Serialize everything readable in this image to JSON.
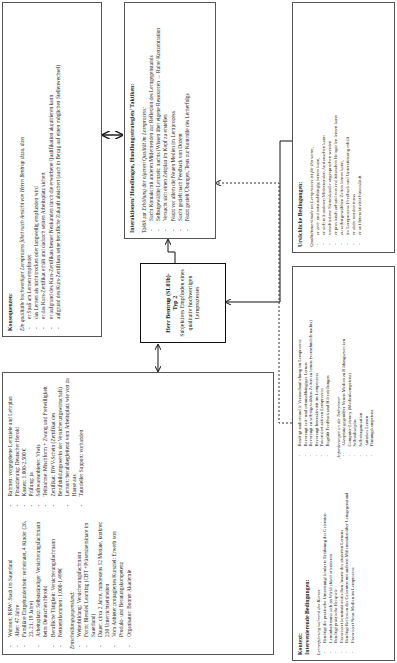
{
  "person_box": {
    "left_items": [
      "Wohnort: NRW: Stadt im Sauerland",
      "Alter: 47 Jahre",
      "Familiäre Eingebundenheit: verheiratet, 4 Kinder (26, 23, 21, 19 Jahre)",
      "Arbeitsplatz: Selbstständiger Versicherungsfachmann beim Deutschen Herold",
      "Berufliche Tätigkeit: Versicherungsfachmann",
      "Nettoeinkommen: 1.000-1.499€"
    ],
    "decision_heading": "Entscheidungsgegenstand:",
    "decision_items": [
      "Weiterbildung: Versicherungsfachmann",
      "Form: Blended Learning (CBT +Präsenzseminare im Sauerland)",
      "Dauer: circa 2 Jahre, mindestens 12 Monate, konkret: 230 Unterrichtseinheiten",
      "Vom Anbieter propagiertes Kursziel: Erwerb von Produkt- und Beratungskompetenz",
      "Organisator: Bonner Akademie"
    ],
    "right_items": [
      "Rahmen: vorgegebene Lernziele und Lehrplan",
      "Finanzierung: Deutscher Herold",
      "Kosten: 1.000-2.500 €",
      "Prüfung: ja",
      "Softwareanbieter: Viwis",
      "Teilnahme: Mischform + Zwang und Freiwilligkeit",
      "Zertifikat: BWV-Schein (Zertifikat des Berufsbildungswerks der Versicherungswirtschaft)",
      "Lernort: berufsbegleitend vom Arbeitsplatz wie von zu Hause aus",
      "Tutorieller Support: vorhanden"
    ]
  },
  "center_box": {
    "title": "Herr Bentrup (SL01b)-Typ 2",
    "subtitle": "Subjektives Empfinden eines qualitativ hochwertigen Lernprozesses"
  },
  "consequences_box": {
    "title": "Konsequenzen:",
    "intro": "Ein qualitativ hochwertiger Lernprozess führt nach Ansicht von Herrn Bentrup dazu, dass",
    "items": [
      "er Spaß am Lernen empfindet",
      "das Lernen als nicht trocken oder langweilig empfunden wird",
      "er das Kurs-Zertifikat erhält und dadurch seinen Arbeitsplatz sichert",
      "er aufgrund des Kurs-Zertifikats besser Neukunden durch die erworbene Qualifikation akquirieren kann",
      "aufgrund des Kurs-Zertifikats seine berufliche Zukunft absichert (auch in Bezug auf einen möglichen Stellenwechsel)"
    ]
  },
  "interactions_box": {
    "title": "Interaktionen/ Handlungen, Handlungsstrategien/ Taktiken:",
    "intro": "Taktik zur Erhöhung der eigenen Qualität im Lernprozess:",
    "items": [
      "Sucht Kontakt mit anderen Mitlernenden zur Reflexion des Lerngegenstands",
      "Selbstgewählte Lernzeit: nachts (Wissen über eigene Ressourcen → Ruhe/ Konzentration",
      "Versucht sich einen Zeitplan im Kopf zu erstellen",
      "Nutzt vor allem die Neuen Medien im Lernprozess",
      "Sucht gezielt nach Feedback von Dozent",
      "Nutzt gezielt Übungen, Tests zur Kontrolle des Lernerfolgs"
    ]
  },
  "context_box": {
    "title": "Kontext:",
    "subtitle": "Intervenierende Bedingungen:",
    "section1_heading": "Lernerfahrung während des Kurses:",
    "section1_items": [
      "Benötigt die praktische Umsetzung/ konkrete Erfahrung des Gelernten",
      "Lerninhalt muss sich an Wirklichkeit orientieren",
      "Benötigt praktische Beispiele",
      "Favorisiert konstruktivistischen Ansatz des situierten Lernens",
      "Benötigt Reflexion des Gelernten mit anderen Mitlernenden über Lerngegenstand",
      "Favorisiert Neue Medien im Lernprozess",
      "Benötigt audiovisuelle Veranschaulichung im Lernprozess",
      "Bevorzugt zeit- und ortsunabhängiges Lernen",
      "Bevorzugt zu selbstgewählten Zeiten zu lernen (vornehmlich nachts)",
      "Bevorzugt Interaktivität im Lernprozess",
      "Favorisiert aktiven Lernprozess",
      "Begrüßt Feedback und Hilfestellungen"
    ],
    "section2_heading": "Anforderungen an die Teilnehmer",
    "section2_items": [
      "Akzeptanz gegenüber Neuen Medien zu Bildungszwecken",
      "Computer-Literacy (Medienkompetenz)",
      "Selbstdisziplin",
      "Selbstorganisation",
      "Autarkes Lernen",
      "Planungskompetenz"
    ]
  },
  "causal_box": {
    "title": "Ursächliche Bedingungen:",
    "intro": "Qualitätsmerkmale im Lernprozess ist für ihn wenn,",
    "items": [
      "er zeit- und ortsunabhängig lernen kann,",
      "er sich mit anderen Mitlernenden Austauschen kann",
      "verschiedene Sinneskanäle angesprochen werden",
      "er praxisnah anhand von realitätsnahen Beispielen lernen kann",
      "zu selbstgewählten Zeiten lernen kann,",
      "im Lernprozess Feedback und Unterstützung erhält",
      "er aktiv werden muss",
      "er auf Interaktivität hinausläuft"
    ]
  },
  "colors": {
    "border": "#555555",
    "text": "#222222",
    "thick_border": "#111111"
  }
}
